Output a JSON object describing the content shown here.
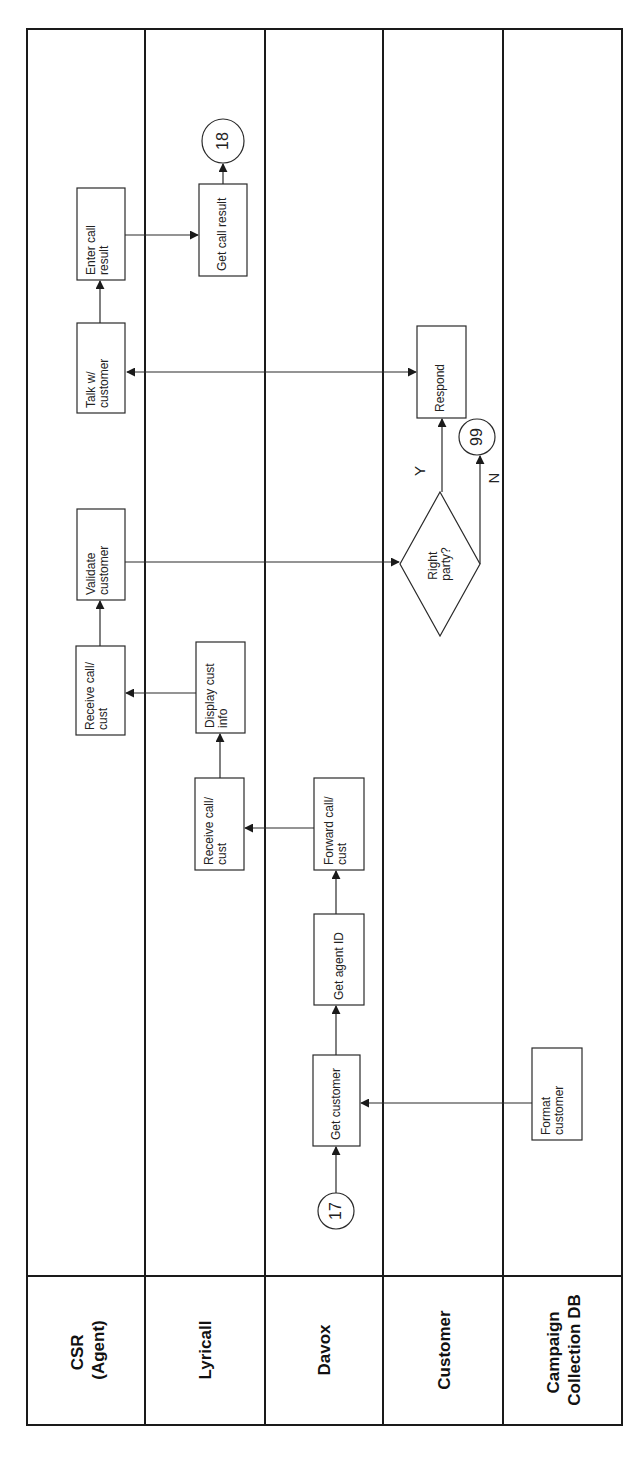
{
  "diagram": {
    "type": "swimlane-flowchart",
    "orientation": "rotated-90-ccw",
    "lanes": [
      {
        "id": "csr",
        "label_line1": "CSR",
        "label_line2": "(Agent)"
      },
      {
        "id": "lyricall",
        "label_line1": "Lyricall",
        "label_line2": ""
      },
      {
        "id": "davox",
        "label_line1": "Davox",
        "label_line2": ""
      },
      {
        "id": "customer",
        "label_line1": "Customer",
        "label_line2": ""
      },
      {
        "id": "campaign",
        "label_line1": "Campaign",
        "label_line2": "Collection DB"
      }
    ],
    "nodes": {
      "start_connector": {
        "label": "17",
        "lane": "davox",
        "shape": "circle"
      },
      "get_customer": {
        "line1": "Get customer",
        "line2": "",
        "lane": "davox"
      },
      "format_customer": {
        "line1": "Format",
        "line2": "customer",
        "lane": "campaign"
      },
      "get_agent_id": {
        "line1": "Get agent ID",
        "line2": "",
        "lane": "davox"
      },
      "forward_call": {
        "line1": "Forward call/",
        "line2": "cust",
        "lane": "davox"
      },
      "lyricall_receive": {
        "line1": "Receive call/",
        "line2": "cust",
        "lane": "lyricall"
      },
      "display_info": {
        "line1": "Display cust",
        "line2": "info",
        "lane": "lyricall"
      },
      "csr_receive": {
        "line1": "Receive call/",
        "line2": "cust",
        "lane": "csr"
      },
      "validate": {
        "line1": "Validate",
        "line2": "customer",
        "lane": "csr"
      },
      "decision": {
        "line1": "Right",
        "line2": "party?",
        "lane": "customer",
        "shape": "diamond"
      },
      "yes_label": "Y",
      "no_label": "N",
      "end_no": {
        "label": "99",
        "lane": "customer",
        "shape": "circle"
      },
      "respond": {
        "line1": "Respond",
        "line2": "",
        "lane": "customer"
      },
      "talk": {
        "line1": "Talk w/",
        "line2": "customer",
        "lane": "csr"
      },
      "enter_result": {
        "line1": "Enter call",
        "line2": "result",
        "lane": "csr"
      },
      "get_result": {
        "line1": "Get call result",
        "line2": "",
        "lane": "lyricall"
      },
      "next_connector": {
        "label": "18",
        "lane": "lyricall",
        "shape": "circle"
      }
    },
    "edges": [
      [
        "17",
        "Get customer"
      ],
      [
        "Format customer",
        "Get customer"
      ],
      [
        "Get customer",
        "Get agent ID"
      ],
      [
        "Get agent ID",
        "Forward call/cust"
      ],
      [
        "Forward call/cust",
        "Receive call/cust (Lyricall)"
      ],
      [
        "Receive call/cust (Lyricall)",
        "Display cust info"
      ],
      [
        "Display cust info",
        "Receive call/cust (CSR)"
      ],
      [
        "Receive call/cust (CSR)",
        "Validate customer"
      ],
      [
        "Validate customer",
        "Right party?"
      ],
      [
        "Right party?",
        "Respond",
        "Y"
      ],
      [
        "Right party?",
        "99",
        "N"
      ],
      [
        "Talk w/ customer",
        "Respond",
        "bidirectional"
      ],
      [
        "Talk w/ customer",
        "Enter call result"
      ],
      [
        "Enter call result",
        "Get call result"
      ],
      [
        "Get call result",
        "18"
      ]
    ],
    "colors": {
      "line": "#2a2a2a",
      "background": "#ffffff",
      "text": "#222222"
    }
  }
}
